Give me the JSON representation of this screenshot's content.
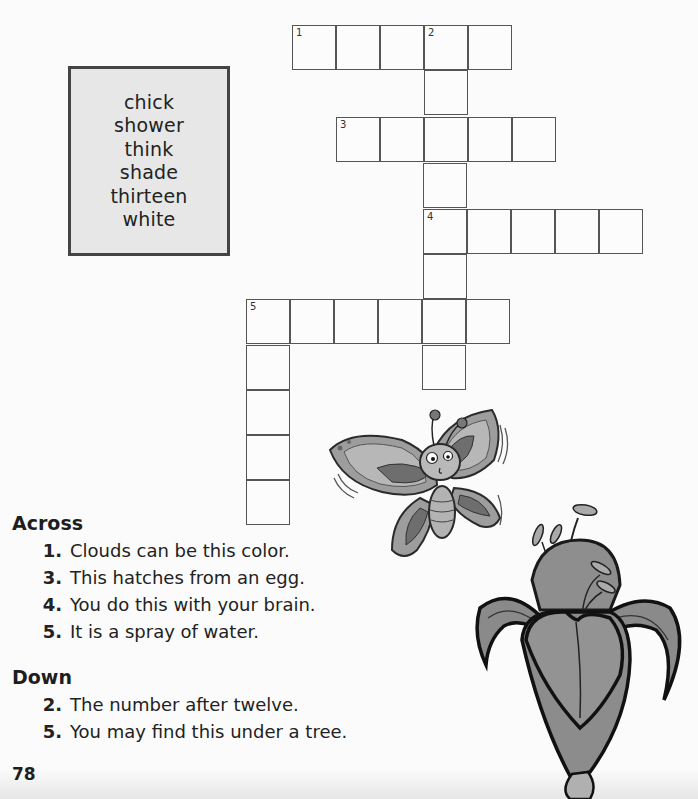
{
  "word_box": {
    "words": [
      "chick",
      "shower",
      "think",
      "shade",
      "thirteen",
      "white"
    ]
  },
  "grid": {
    "cell_size": 44,
    "cells": [
      {
        "x": 292,
        "y": 25,
        "num": "1"
      },
      {
        "x": 336,
        "y": 25,
        "num": ""
      },
      {
        "x": 380,
        "y": 25,
        "num": ""
      },
      {
        "x": 424,
        "y": 25,
        "num": "2"
      },
      {
        "x": 468,
        "y": 25,
        "num": ""
      },
      {
        "x": 424,
        "y": 70,
        "num": ""
      },
      {
        "x": 336,
        "y": 117,
        "num": "3"
      },
      {
        "x": 380,
        "y": 117,
        "num": ""
      },
      {
        "x": 424,
        "y": 117,
        "num": ""
      },
      {
        "x": 468,
        "y": 117,
        "num": ""
      },
      {
        "x": 512,
        "y": 117,
        "num": ""
      },
      {
        "x": 423,
        "y": 163,
        "num": ""
      },
      {
        "x": 423,
        "y": 209,
        "num": "4"
      },
      {
        "x": 467,
        "y": 209,
        "num": ""
      },
      {
        "x": 511,
        "y": 209,
        "num": ""
      },
      {
        "x": 555,
        "y": 209,
        "num": ""
      },
      {
        "x": 599,
        "y": 209,
        "num": ""
      },
      {
        "x": 423,
        "y": 254,
        "num": ""
      },
      {
        "x": 246,
        "y": 299,
        "num": "5"
      },
      {
        "x": 290,
        "y": 299,
        "num": ""
      },
      {
        "x": 334,
        "y": 299,
        "num": ""
      },
      {
        "x": 378,
        "y": 299,
        "num": ""
      },
      {
        "x": 422,
        "y": 299,
        "num": ""
      },
      {
        "x": 466,
        "y": 299,
        "num": ""
      },
      {
        "x": 422,
        "y": 345,
        "num": ""
      },
      {
        "x": 246,
        "y": 345,
        "num": ""
      },
      {
        "x": 246,
        "y": 390,
        "num": ""
      },
      {
        "x": 246,
        "y": 435,
        "num": ""
      },
      {
        "x": 246,
        "y": 480,
        "num": ""
      }
    ]
  },
  "across": {
    "heading": "Across",
    "clues": [
      {
        "num": "1.",
        "text": "Clouds can be this color."
      },
      {
        "num": "3.",
        "text": "This hatches from an egg."
      },
      {
        "num": "4.",
        "text": "You do this with your brain."
      },
      {
        "num": "5.",
        "text": "It is a spray of water."
      }
    ]
  },
  "down": {
    "heading": "Down",
    "clues": [
      {
        "num": "2.",
        "text": "The number after twelve."
      },
      {
        "num": "5.",
        "text": "You may find this under a tree."
      }
    ]
  },
  "page_number": "78",
  "illustrations": [
    "butterfly-illustration",
    "lily-flower-illustration"
  ]
}
